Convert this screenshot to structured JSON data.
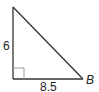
{
  "diagram": {
    "type": "right-triangle",
    "vertices": {
      "top": {
        "x": 13,
        "y": 7
      },
      "right_angle": {
        "x": 13,
        "y": 79
      },
      "B": {
        "x": 83,
        "y": 79
      }
    },
    "labels": {
      "vertical_leg": "6",
      "horizontal_leg": "8.5",
      "vertex_B": "B"
    },
    "right_angle_marker_size": 11,
    "colors": {
      "stroke": "#333333",
      "marker": "#9a9a9a",
      "text": "#222222"
    }
  }
}
